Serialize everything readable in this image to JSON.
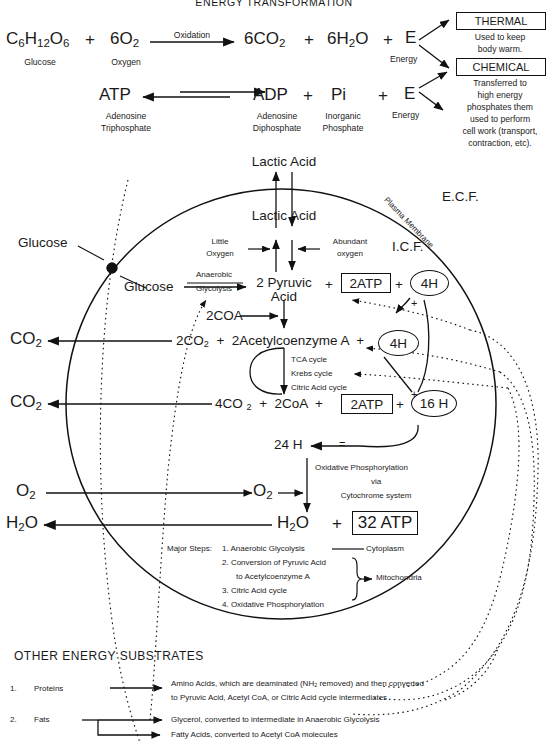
{
  "title": "ENERGY TRANSFORMATION",
  "overall_equation": {
    "glucose_formula_parts": {
      "c": "C",
      "n6": "6",
      "h": "H",
      "n12": "12",
      "o": "O",
      "n6b": "6"
    },
    "glucose_label": "Glucose",
    "plus1": "+",
    "oxygen_formula": "6O",
    "oxygen_sub": "2",
    "oxygen_label": "Oxygen",
    "reaction_label": "Oxidation",
    "co2": "6CO",
    "co2_sub": "2",
    "plus2": "+",
    "h2o": "6H",
    "h2o_sub": "2",
    "h2o_tail": "O",
    "plus3": "+",
    "energy_symbol": "E",
    "energy_label": "Energy"
  },
  "atp_equation": {
    "atp": "ATP",
    "atp_name_line1": "Adenosine",
    "atp_name_line2": "Triphosphate",
    "adp": "ADP",
    "adp_name_line1": "Adenosine",
    "adp_name_line2": "Diphosphate",
    "plus1": "+",
    "pi": "Pi",
    "pi_name_line1": "Inorganic",
    "pi_name_line2": "Phosphate",
    "plus2": "+",
    "energy_symbol": "E",
    "energy_label": "Energy"
  },
  "energy_fates": {
    "thermal": {
      "heading": "THERMAL",
      "line1": "Used to keep",
      "line2": "body warm."
    },
    "chemical": {
      "heading": "CHEMICAL",
      "line1": "Transferred to",
      "line2": "high energy",
      "line3": "phosphates them",
      "line4": "used to perform",
      "line5": "cell work (transport,",
      "line6": "contraction, etc)."
    }
  },
  "cell": {
    "membrane_label": "Plasma Membrane",
    "ecf_label": "E.C.F.",
    "icf_label": "I.C.F.",
    "lactic_acid_outside": "Lactic Acid",
    "lactic_acid_inside": "Lactic Acid",
    "little_oxygen_line1": "Little",
    "little_oxygen_line2": "Oxygen",
    "abundant_oxygen_line1": "Abundant",
    "abundant_oxygen_line2": "oxygen",
    "glucose_outside": "Glucose",
    "glucose_inside": "Glucose",
    "glycolysis_line1": "Anaerobic",
    "glycolysis_line2": "Glycolysis",
    "pyruvic_line1": "2 Pyruvic",
    "pyruvic_line2": "Acid",
    "plus_a": "+",
    "atp_box_1": "2ATP",
    "plus_b": "+",
    "oval_4h_1": "4H",
    "plus_join_1": "+",
    "coa_input": "2COA",
    "co2_out_1": "CO",
    "co2_out_1_sub": "2",
    "acetyl_line": "2CO",
    "acetyl_line_sub": "2",
    "acetyl_line_rest": "+  2Acetylcoenzyme A  +",
    "oval_4h_2": "4H",
    "tca_line1": "TCA cycle",
    "tca_line2": "Krebs cycle",
    "tca_line3": "Citric Acid cycle",
    "co2_out_2": "CO",
    "co2_out_2_sub": "2",
    "products_co2": "4CO",
    "products_co2_sub": "2",
    "products_rest": "+   2CoA   +",
    "atp_box_2": "2ATP",
    "plus_c": "+",
    "oval_16h": "16 H",
    "plus_join_2": "+",
    "sum_24h": "24 H",
    "equals_sign": "=",
    "oxphos_line1": "Oxidative Phosphorylation",
    "oxphos_line2": "via",
    "oxphos_line3": "Cytochrome system",
    "o2_outside": "O",
    "o2_outside_sub": "2",
    "o2_inside": "O",
    "o2_inside_sub": "2",
    "h2o_outside": "H",
    "h2o_outside_sub": "2",
    "h2o_outside_tail": "O",
    "h2o_inside": "H",
    "h2o_inside_sub": "2",
    "h2o_inside_tail": "O",
    "plus_d": "+",
    "atp_box_32": "32 ATP"
  },
  "major_steps": {
    "heading": "Major Steps:",
    "items": [
      "1. Anaerobic Glycolysis",
      "2. Conversion of Pyruvic Acid",
      "to Acetylcoenzyme A",
      "3. Citric Acid cycle",
      "4. Oxidative Phosphorylation"
    ],
    "location_cytoplasm": "Cytoplasm",
    "location_mitochondria": "Mitochondria"
  },
  "other_substrates": {
    "heading": "OTHER ENERGY SUBSTRATES",
    "rows": [
      {
        "num": "1.",
        "name": "Proteins",
        "desc_line1_a": "Amino Acids, which are deaminated (NH",
        "desc_line1_sub": "2",
        "desc_line1_b": " removed) and then converted",
        "desc_line2": "to Pyruvic Acid, Acetyl CoA, or Citric Acid cycle intermediates"
      },
      {
        "num": "2.",
        "name": "Fats",
        "desc_line1_a": "Glycerol, converted to intermediate in Anaerobic Glycolysis",
        "desc_line1_sub": "",
        "desc_line1_b": "",
        "desc_line2": "Fatty Acids, converted to Acetyl CoA molecules"
      }
    ]
  },
  "colors": {
    "ink": "#1a1a1a",
    "line": "#111111",
    "paper": "#ffffff"
  }
}
